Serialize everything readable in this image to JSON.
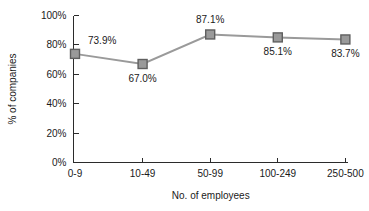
{
  "chart_data": {
    "type": "line",
    "title": "",
    "subtitle": "",
    "xlabel": "No. of employees",
    "ylabel": "% of companies",
    "categories": [
      "0-9",
      "10-49",
      "50-99",
      "100-249",
      "250-500"
    ],
    "values": [
      73.9,
      67.0,
      87.1,
      85.1,
      83.7
    ],
    "point_labels": [
      "73.9%",
      "67.0%",
      "87.1%",
      "85.1%",
      "83.7%"
    ],
    "label_positions": [
      "above-right",
      "below",
      "above",
      "below",
      "below"
    ],
    "ylim": [
      0,
      100
    ],
    "y_ticks": [
      0,
      20,
      40,
      60,
      80,
      100
    ],
    "y_tick_labels": [
      "0%",
      "20%",
      "40%",
      "60%",
      "80%",
      "100%"
    ],
    "grid": false,
    "legend": "none",
    "series": [
      {
        "name": "% of companies",
        "values": [
          73.9,
          67.0,
          87.1,
          85.1,
          83.7
        ]
      }
    ],
    "colors": {
      "line": "#9a9a9a",
      "marker_fill": "#9a9a9a",
      "marker_stroke": "#5f5f5f",
      "axis": "#2b2b2b",
      "text": "#1a1a1a",
      "background": "#ffffff"
    },
    "marker_shape": "square"
  }
}
